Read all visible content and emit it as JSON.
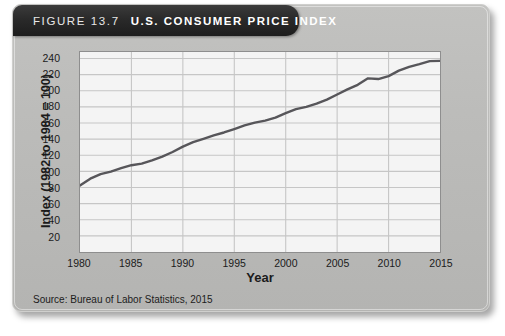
{
  "figure": {
    "label": "FIGURE 13.7",
    "title": "U.S. CONSUMER PRICE INDEX",
    "source": "Source: Bureau of Labor Statistics, 2015"
  },
  "colors": {
    "card": "#b9b9b7",
    "banner": "#222222",
    "plot_background": "#f4f4f4",
    "gridline": "#c6c6c6",
    "line": "#57565a",
    "axis": "#8e8e8e",
    "text": "#1b1b1b"
  },
  "chart_data": {
    "type": "line",
    "title": "U.S. Consumer Price Index",
    "xlabel": "Year",
    "ylabel": "Index (1982 to 1984 = 100)",
    "xlim": [
      1980,
      2015
    ],
    "ylim": [
      0,
      248
    ],
    "grid": true,
    "legend": "none",
    "xticks": [
      1980,
      1985,
      1990,
      1995,
      2000,
      2005,
      2010,
      2015
    ],
    "yticks": [
      20,
      40,
      60,
      80,
      100,
      120,
      140,
      160,
      180,
      200,
      220,
      240
    ],
    "series": [
      {
        "name": "Consumer Price Index (CPI-U)",
        "x": [
          1980,
          1981,
          1982,
          1983,
          1984,
          1985,
          1986,
          1987,
          1988,
          1989,
          1990,
          1991,
          1992,
          1993,
          1994,
          1995,
          1996,
          1997,
          1998,
          1999,
          2000,
          2001,
          2002,
          2003,
          2004,
          2005,
          2006,
          2007,
          2008,
          2009,
          2010,
          2011,
          2012,
          2013,
          2014,
          2015
        ],
        "values": [
          82.4,
          90.9,
          96.5,
          99.6,
          103.9,
          107.6,
          109.6,
          113.6,
          118.3,
          124.0,
          130.7,
          136.2,
          140.3,
          144.5,
          148.2,
          152.4,
          156.9,
          160.5,
          163.0,
          166.6,
          172.2,
          177.1,
          179.9,
          184.0,
          188.9,
          195.3,
          201.6,
          207.3,
          215.3,
          214.5,
          218.1,
          224.9,
          229.6,
          233.0,
          236.7,
          237.0
        ]
      }
    ]
  }
}
